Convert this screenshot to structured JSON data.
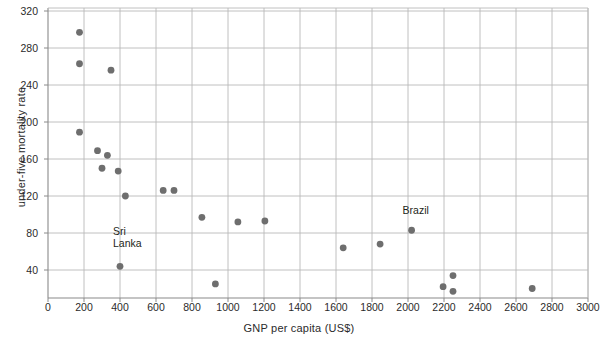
{
  "chart_data": {
    "type": "scatter",
    "title": "",
    "xlabel": "GNP per capita (US$)",
    "ylabel": "under-five mortality rate",
    "xlim": [
      0,
      3000
    ],
    "ylim": [
      9,
      320
    ],
    "xticks": [
      0,
      200,
      400,
      600,
      800,
      1000,
      1200,
      1400,
      1600,
      1800,
      2000,
      2200,
      2400,
      2600,
      2800,
      3000
    ],
    "yticks": [
      40,
      80,
      120,
      160,
      200,
      240,
      280,
      320
    ],
    "grid": true,
    "legend": "none",
    "marker_color": "#6e6e6e",
    "grid_color": "#b9b9b9",
    "axis_color": "#8a8a8a",
    "points": [
      {
        "x": 175,
        "y": 297,
        "label": ""
      },
      {
        "x": 175,
        "y": 263,
        "label": ""
      },
      {
        "x": 350,
        "y": 256,
        "label": ""
      },
      {
        "x": 175,
        "y": 189,
        "label": ""
      },
      {
        "x": 275,
        "y": 169,
        "label": ""
      },
      {
        "x": 330,
        "y": 164,
        "label": ""
      },
      {
        "x": 300,
        "y": 150,
        "label": ""
      },
      {
        "x": 390,
        "y": 147,
        "label": ""
      },
      {
        "x": 430,
        "y": 120,
        "label": ""
      },
      {
        "x": 640,
        "y": 126,
        "label": ""
      },
      {
        "x": 700,
        "y": 126,
        "label": ""
      },
      {
        "x": 855,
        "y": 97,
        "label": ""
      },
      {
        "x": 1055,
        "y": 92,
        "label": ""
      },
      {
        "x": 1205,
        "y": 93,
        "label": ""
      },
      {
        "x": 400,
        "y": 44,
        "label": "Sri\nLanka"
      },
      {
        "x": 930,
        "y": 25,
        "label": ""
      },
      {
        "x": 1640,
        "y": 64,
        "label": ""
      },
      {
        "x": 1845,
        "y": 68,
        "label": ""
      },
      {
        "x": 2020,
        "y": 83,
        "label": "Brazil"
      },
      {
        "x": 2250,
        "y": 34,
        "label": ""
      },
      {
        "x": 2195,
        "y": 22,
        "label": ""
      },
      {
        "x": 2250,
        "y": 17,
        "label": ""
      },
      {
        "x": 2690,
        "y": 20,
        "label": ""
      }
    ],
    "annotations": [
      {
        "text": "Sri\nLanka",
        "x": 400,
        "y": 44,
        "dx": -7,
        "dy": -28
      },
      {
        "text": "Brazil",
        "x": 2020,
        "y": 83,
        "dx": -9,
        "dy": -13
      }
    ]
  }
}
